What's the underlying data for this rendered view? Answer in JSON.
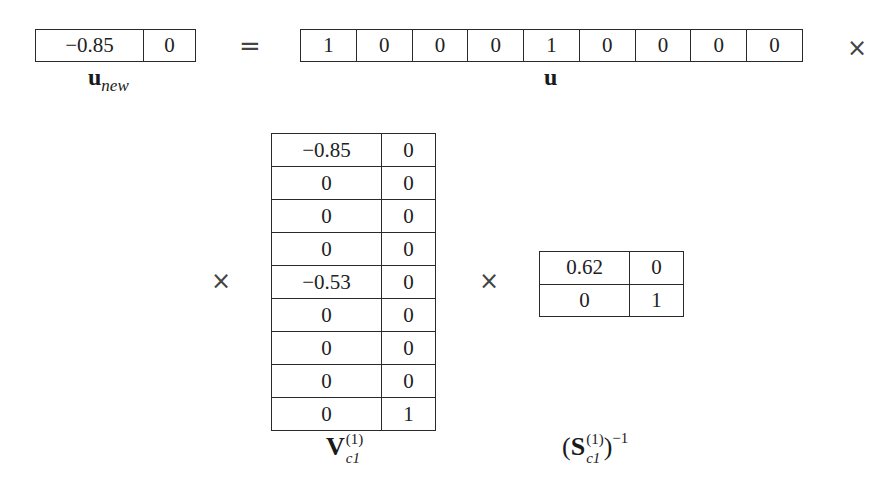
{
  "equation": {
    "lhs": {
      "name": "u_new",
      "label": {
        "base": "u",
        "sub": "new"
      },
      "values": [
        "−0.85",
        "0"
      ]
    },
    "equals": "=",
    "times_symbol": "×",
    "u": {
      "label": {
        "base": "u"
      },
      "values": [
        "1",
        "0",
        "0",
        "0",
        "1",
        "0",
        "0",
        "0",
        "0"
      ]
    },
    "V": {
      "label": {
        "base": "V",
        "sub": "c1",
        "sup": "(1)"
      },
      "rows": [
        [
          "−0.85",
          "0"
        ],
        [
          "0",
          "0"
        ],
        [
          "0",
          "0"
        ],
        [
          "0",
          "0"
        ],
        [
          "−0.53",
          "0"
        ],
        [
          "0",
          "0"
        ],
        [
          "0",
          "0"
        ],
        [
          "0",
          "0"
        ],
        [
          "0",
          "1"
        ]
      ]
    },
    "S_inv": {
      "label": {
        "open": "(",
        "base": "S",
        "sub": "c1",
        "sup": "(1)",
        "close": ")",
        "exp": "−1"
      },
      "rows": [
        [
          "0.62",
          "0"
        ],
        [
          "0",
          "1"
        ]
      ]
    }
  }
}
